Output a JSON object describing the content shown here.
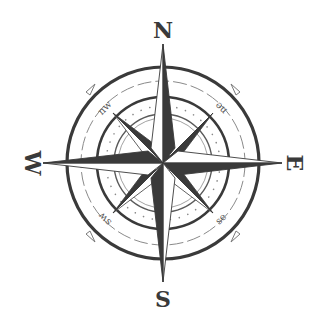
{
  "image": {
    "subject": "compass rose",
    "colors": {
      "ink": "#3a3a3a",
      "light_ink": "#8a8a8a",
      "background": "#ffffff"
    }
  },
  "cardinals": [
    {
      "label": "N"
    },
    {
      "label": "E"
    },
    {
      "label": "S"
    },
    {
      "label": "W"
    }
  ],
  "intercardinals": [
    {
      "label": "ne"
    },
    {
      "label": "se"
    },
    {
      "label": "sw"
    },
    {
      "label": "nw"
    }
  ]
}
